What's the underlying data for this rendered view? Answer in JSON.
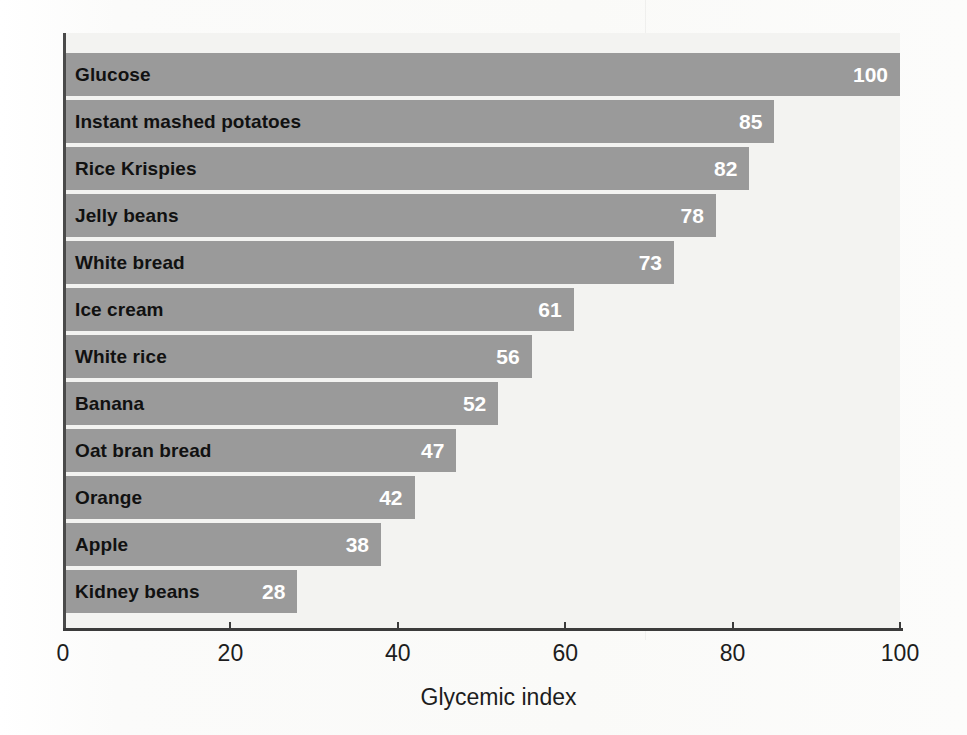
{
  "figure": {
    "background_color": "#fdfdfc",
    "plot_background_color": "#f3f3f1",
    "bar_color": "#9a9a9a",
    "value_label_color": "#ffffff",
    "category_label_color": "#111111",
    "axis_color": "#3b3b3b"
  },
  "chart_data": {
    "type": "bar",
    "orientation": "horizontal",
    "title": "",
    "subtitle": "",
    "xlabel": "Glycemic index",
    "ylabel": "",
    "xlim": [
      0,
      100
    ],
    "xticks": [
      0,
      20,
      40,
      60,
      80,
      100
    ],
    "xtick_labels": [
      "0",
      "20",
      "40",
      "60",
      "80",
      "100"
    ],
    "grid": false,
    "legend": null,
    "show_value_labels": true,
    "categories": [
      "Glucose",
      "Instant mashed potatoes",
      "Rice Krispies",
      "Jelly beans",
      "White bread",
      "Ice cream",
      "White rice",
      "Banana",
      "Oat bran bread",
      "Orange",
      "Apple",
      "Kidney beans"
    ],
    "values": [
      100,
      85,
      82,
      78,
      73,
      61,
      56,
      52,
      47,
      42,
      38,
      28
    ],
    "value_labels": [
      "100",
      "85",
      "82",
      "78",
      "73",
      "61",
      "56",
      "52",
      "47",
      "42",
      "38",
      "28"
    ]
  }
}
